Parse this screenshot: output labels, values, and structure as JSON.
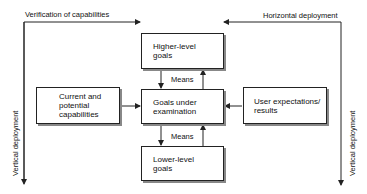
{
  "diagram": {
    "top_left_label": "Verification of capabilities",
    "top_right_label": "Horizontal deployment",
    "left_vertical_label": "Vertical deployment",
    "right_vertical_label": "Vertical deployment",
    "means_upper": "Means",
    "means_lower": "Means",
    "boxes": {
      "higher": "Higher-level\ngoals",
      "center": "Goals under\nexamination",
      "lower": "Lower-level\ngoals",
      "left": "Current and\npotential\ncapabilities",
      "right": "User expectations/\nresults"
    },
    "colors": {
      "line": "#222222",
      "shadow": "#888888",
      "background": "#ffffff"
    }
  }
}
